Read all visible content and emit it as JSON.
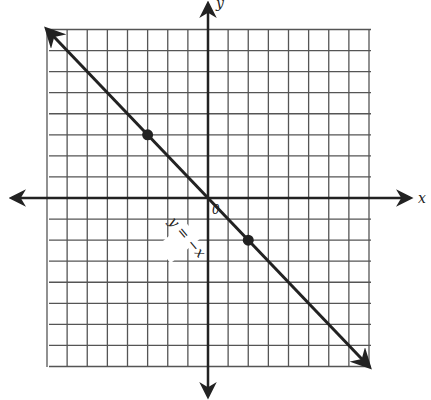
{
  "graph": {
    "grid": {
      "xmin": -8,
      "xmax": 8,
      "ymin": -8,
      "ymax": 8
    },
    "axes": {
      "x_label": "x",
      "y_label": "y",
      "origin_label": "0"
    },
    "line": {
      "equation_label": "y = −x",
      "slope": -1,
      "intercept": 0
    },
    "points": [
      {
        "x": -3,
        "y": 3
      },
      {
        "x": 2,
        "y": -2
      }
    ],
    "colors": {
      "ink": "#222222",
      "grid": "#555555",
      "background": "#ffffff"
    }
  }
}
